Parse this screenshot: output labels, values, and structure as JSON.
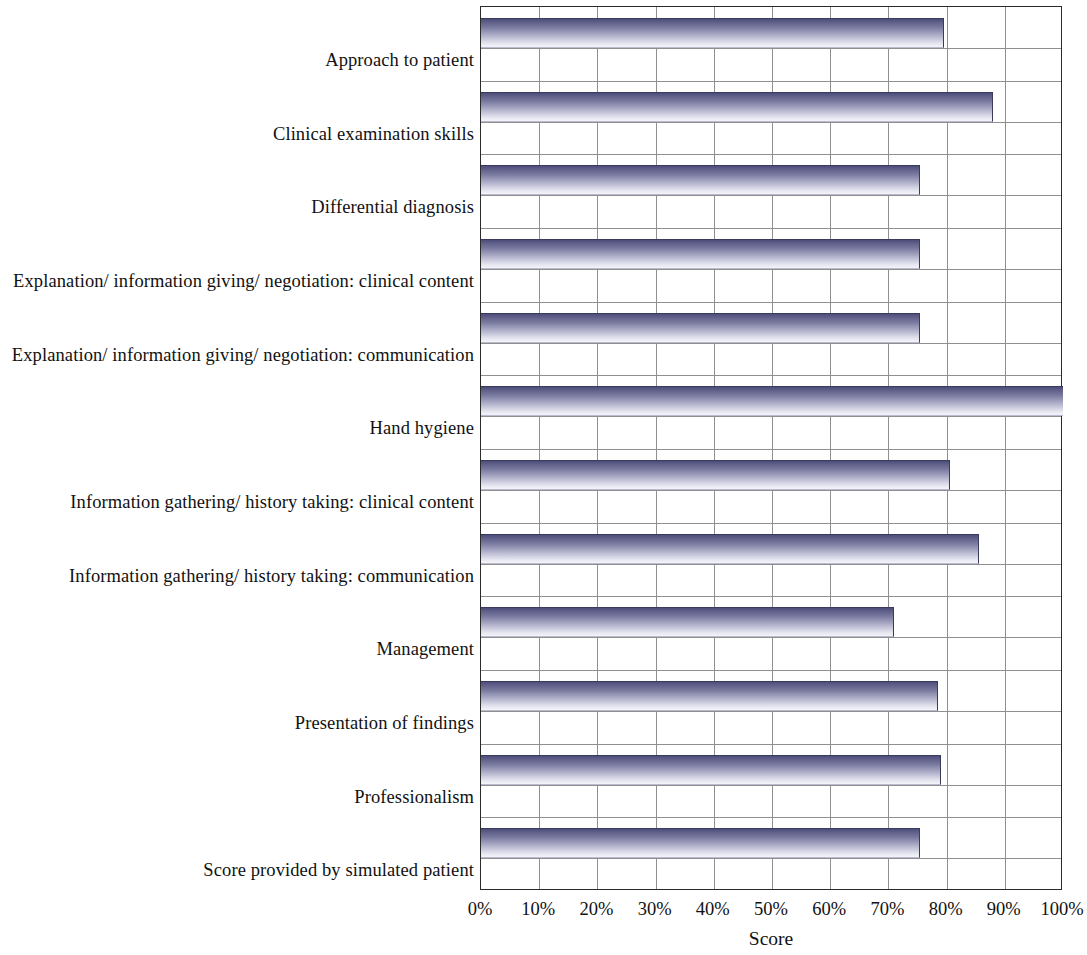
{
  "chart_data": {
    "type": "bar",
    "orientation": "horizontal",
    "title": "",
    "xlabel": "Score",
    "ylabel": "",
    "xlim": [
      0,
      100
    ],
    "xtick_labels": [
      "0%",
      "10%",
      "20%",
      "30%",
      "40%",
      "50%",
      "60%",
      "70%",
      "80%",
      "90%",
      "100%"
    ],
    "xticks": [
      0,
      10,
      20,
      30,
      40,
      50,
      60,
      70,
      80,
      90,
      100
    ],
    "grid": true,
    "legend_position": "top-right",
    "legend": [
      "You"
    ],
    "categories": [
      "Approach to patient",
      "Clinical examination skills",
      "Differential diagnosis",
      "Explanation/ information giving/ negotiation: clinical content",
      "Explanation/ information giving/ negotiation: communication",
      "Hand hygiene",
      "Information gathering/ history taking: clinical content",
      "Information gathering/ history taking: communication",
      "Management",
      "Presentation of findings",
      "Professionalism",
      "Score provided by simulated patient"
    ],
    "series": [
      {
        "name": "You",
        "values": [
          79.5,
          88,
          75.5,
          75.5,
          75.5,
          100,
          80.5,
          85.5,
          71,
          78.5,
          79,
          75.5
        ]
      }
    ],
    "colors": {
      "bar_gradient_top": "#4d4d7a",
      "bar_gradient_bottom": "#f4f4f9",
      "axis": "#2b2b2b",
      "gridline": "#8f8f8f",
      "text": "#111111",
      "background": "#ffffff"
    }
  }
}
